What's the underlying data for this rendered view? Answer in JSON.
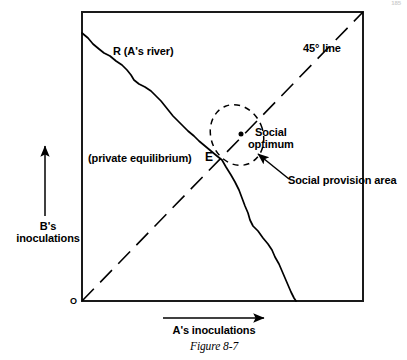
{
  "figure": {
    "caption": "Figure 8-7",
    "page_number": "185"
  },
  "axes": {
    "origin_label": "O",
    "y_axis_label": "B's\ninoculations",
    "x_axis_label": "A's inoculations",
    "y_arrow_icon": "up-arrow-icon",
    "x_arrow_icon": "right-arrow-icon"
  },
  "annotations": {
    "river": "R (A's river)",
    "line45": "45° line",
    "private_equilibrium": "(private equilibrium)",
    "equilibrium_point": "E",
    "social_optimum": "Social\noptimum",
    "social_provision_area": "Social provision area"
  },
  "colors": {
    "ink": "#000000",
    "background": "#ffffff"
  },
  "chart_data": {
    "type": "line",
    "title": "Figure 8-7",
    "xlabel": "A's inoculations",
    "ylabel": "B's inoculations",
    "series": [
      {
        "name": "R (A's river)",
        "style": "solid-wavy",
        "points": [
          [
            82,
            33
          ],
          [
            92,
            43
          ],
          [
            103,
            52
          ],
          [
            112,
            57
          ],
          [
            122,
            64
          ],
          [
            131,
            72
          ],
          [
            136,
            80
          ],
          [
            144,
            86
          ],
          [
            152,
            90
          ],
          [
            160,
            99
          ],
          [
            166,
            108
          ],
          [
            172,
            113
          ],
          [
            178,
            122
          ],
          [
            186,
            129
          ],
          [
            193,
            137
          ],
          [
            200,
            143
          ],
          [
            208,
            150
          ],
          [
            215,
            156
          ],
          [
            222,
            160
          ],
          [
            230,
            173
          ],
          [
            238,
            185
          ],
          [
            244,
            196
          ],
          [
            249,
            207
          ],
          [
            252,
            218
          ],
          [
            258,
            228
          ],
          [
            265,
            237
          ],
          [
            272,
            246
          ],
          [
            277,
            257
          ],
          [
            282,
            268
          ],
          [
            288,
            280
          ],
          [
            293,
            292
          ],
          [
            297,
            301
          ]
        ]
      },
      {
        "name": "45° line",
        "style": "dashed",
        "points": [
          [
            82,
            301
          ],
          [
            363,
            12
          ]
        ]
      }
    ],
    "markers": [
      {
        "name": "Social optimum",
        "x": 241,
        "y": 134,
        "style": "filled-dot"
      },
      {
        "name": "E",
        "x": 222,
        "y": 160,
        "style": "intersection"
      }
    ],
    "regions": [
      {
        "name": "Social provision area",
        "style": "dashed-ellipse",
        "center_x": 237,
        "center_y": 135,
        "radius_x": 26,
        "radius_y": 31,
        "rotation_deg": -22
      }
    ],
    "grid": false,
    "legend": false
  }
}
